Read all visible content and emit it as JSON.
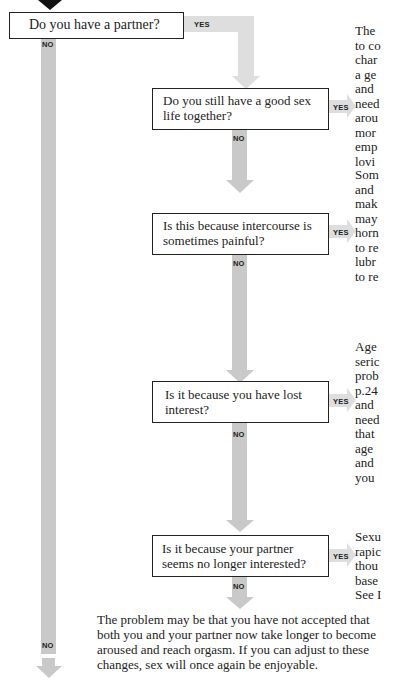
{
  "flowchart": {
    "labels": {
      "yes": "YES",
      "no": "NO"
    },
    "questions": [
      {
        "id": "q1",
        "text": "Do you have a partner?"
      },
      {
        "id": "q2",
        "text": "Do you still have a good sex life together?"
      },
      {
        "id": "q3",
        "text": "Is this because intercourse is sometimes painful?"
      },
      {
        "id": "q4",
        "text": "Is it because you have lost interest?"
      },
      {
        "id": "q5",
        "text": "Is it because your partner seems no longer interested?"
      }
    ],
    "side_texts": [
      {
        "lines": "The\nto co\nchar\na ge\nand\nneed\narou\nmor\nemp\nlovi"
      },
      {
        "lines": "Som\nand\nmak\nmay\nhorn\nto re\nlubr\nto re"
      },
      {
        "lines": "Age\nseric\nprob\np.24\nand\nneed\nthat\nage\nand\nyou"
      },
      {
        "lines": "Sexu\nrapic\nthou\nbase\nSee I"
      }
    ],
    "conclusion": "The problem may be that you have not accepted that both you and your partner now take longer to become aroused and reach orgasm. If you can adjust to these changes, sex will once again be enjoyable."
  },
  "colors": {
    "connector": "#c9c9c9",
    "connector_light": "#dedede",
    "border": "#222222",
    "start_arrow": "#111111"
  }
}
